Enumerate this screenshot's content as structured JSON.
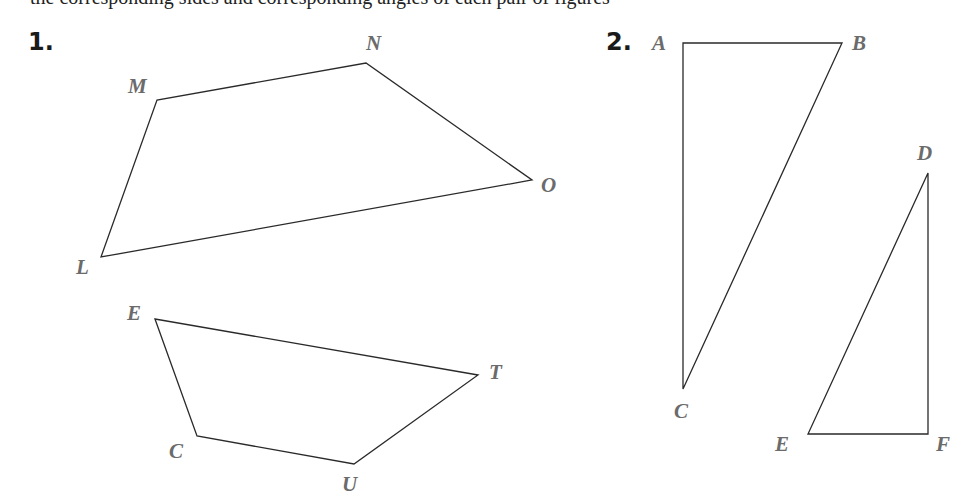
{
  "header": {
    "partial_text": "the corresponding sides and corresponding angles of each pair of figures"
  },
  "problems": [
    {
      "number": "1.",
      "figures": [
        {
          "name": "LMNO",
          "vertices": [
            {
              "label": "L",
              "x": 101,
              "y": 257,
              "lx": 76,
              "ly": 274
            },
            {
              "label": "M",
              "x": 157,
              "y": 100,
              "lx": 128,
              "ly": 93
            },
            {
              "label": "N",
              "x": 366,
              "y": 63,
              "lx": 366,
              "ly": 50
            },
            {
              "label": "O",
              "x": 532,
              "y": 180,
              "lx": 541,
              "ly": 192
            }
          ]
        },
        {
          "name": "ETUC",
          "vertices": [
            {
              "label": "E",
              "x": 155,
              "y": 319,
              "lx": 127,
              "ly": 320
            },
            {
              "label": "T",
              "x": 478,
              "y": 375,
              "lx": 489,
              "ly": 379
            },
            {
              "label": "U",
              "x": 354,
              "y": 464,
              "lx": 342,
              "ly": 491
            },
            {
              "label": "C",
              "x": 197,
              "y": 436,
              "lx": 169,
              "ly": 458
            }
          ]
        }
      ]
    },
    {
      "number": "2.",
      "figures": [
        {
          "name": "ABC",
          "vertices": [
            {
              "label": "A",
              "x": 683,
              "y": 43,
              "lx": 652,
              "ly": 50
            },
            {
              "label": "B",
              "x": 842,
              "y": 43,
              "lx": 852,
              "ly": 50
            },
            {
              "label": "C",
              "x": 683,
              "y": 389,
              "lx": 674,
              "ly": 418
            }
          ]
        },
        {
          "name": "DEF",
          "vertices": [
            {
              "label": "D",
              "x": 928,
              "y": 173,
              "lx": 917,
              "ly": 160
            },
            {
              "label": "E",
              "x": 808,
              "y": 434,
              "lx": 775,
              "ly": 451
            },
            {
              "label": "F",
              "x": 928,
              "y": 434,
              "lx": 936,
              "ly": 451
            }
          ]
        }
      ]
    }
  ]
}
